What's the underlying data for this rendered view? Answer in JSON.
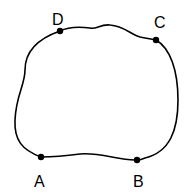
{
  "diagram": {
    "stroke_color": "#000000",
    "background": "#ffffff",
    "points": [
      {
        "id": "A",
        "label": "A",
        "x": 41,
        "y": 157,
        "label_x": 40,
        "label_y": 187
      },
      {
        "id": "B",
        "label": "B",
        "x": 137,
        "y": 160,
        "label_x": 139,
        "label_y": 187
      },
      {
        "id": "C",
        "label": "C",
        "x": 156,
        "y": 40,
        "label_x": 160,
        "label_y": 28
      },
      {
        "id": "D",
        "label": "D",
        "x": 60,
        "y": 31,
        "label_x": 58,
        "label_y": 25
      }
    ]
  }
}
